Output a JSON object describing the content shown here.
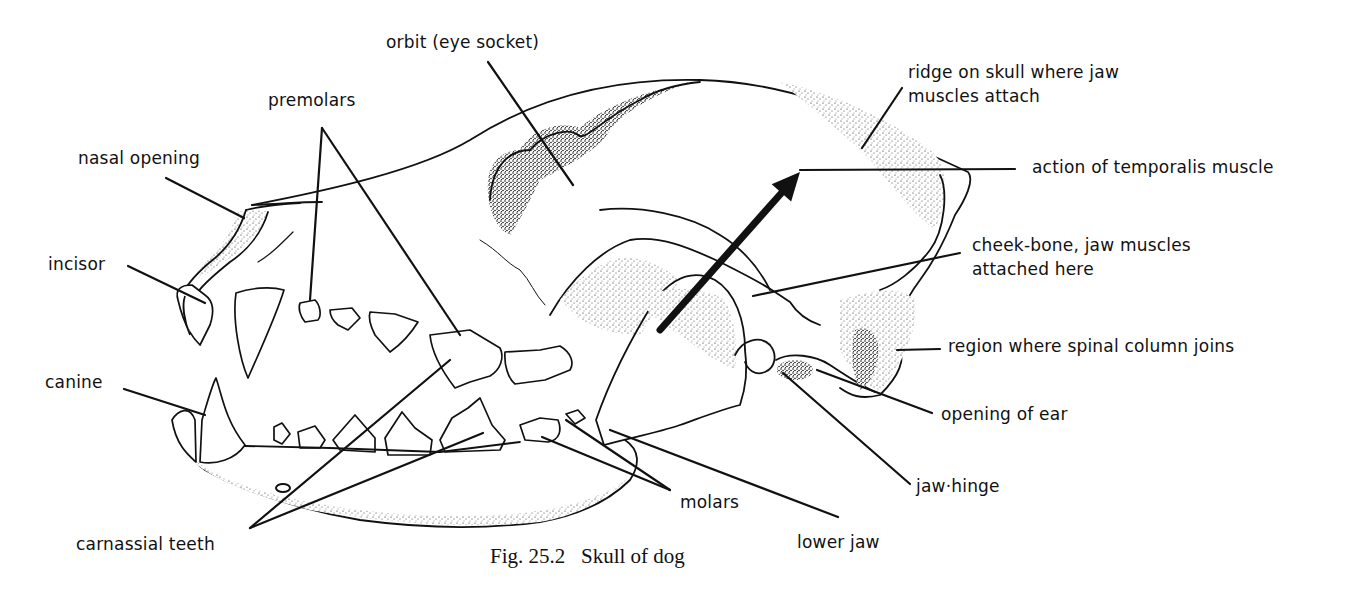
{
  "figure": {
    "caption": "Fig. 25.2   Skull of dog",
    "subject": "Skull of dog",
    "figure_number": "25.2",
    "colors": {
      "ink": "#111111",
      "background": "#ffffff"
    }
  },
  "labels": [
    {
      "id": "orbit",
      "text": "orbit (eye socket)",
      "x": 386,
      "y": 30
    },
    {
      "id": "premolars",
      "text": "premolars",
      "x": 268,
      "y": 88
    },
    {
      "id": "ridge",
      "text_lines": [
        "ridge on skull where jaw",
        "muscles attach"
      ],
      "x": 908,
      "y": 60
    },
    {
      "id": "nasal-opening",
      "text": "nasal opening",
      "x": 78,
      "y": 146
    },
    {
      "id": "temporalis",
      "text": "action of temporalis muscle",
      "x": 1032,
      "y": 155
    },
    {
      "id": "incisor",
      "text": "incisor",
      "x": 48,
      "y": 252
    },
    {
      "id": "cheek-bone",
      "text_lines": [
        "cheek-bone, jaw muscles",
        "attached here"
      ],
      "x": 972,
      "y": 233
    },
    {
      "id": "spinal-column",
      "text": "region where spinal column joins",
      "x": 948,
      "y": 334
    },
    {
      "id": "canine",
      "text": "canine",
      "x": 45,
      "y": 370
    },
    {
      "id": "ear-opening",
      "text": "opening of ear",
      "x": 941,
      "y": 402
    },
    {
      "id": "jaw-hinge",
      "text": "jaw·hinge",
      "x": 916,
      "y": 474
    },
    {
      "id": "molars",
      "text": "molars",
      "x": 680,
      "y": 490
    },
    {
      "id": "lower-jaw",
      "text": "lower jaw",
      "x": 797,
      "y": 530
    },
    {
      "id": "carnassial",
      "text": "carnassial teeth",
      "x": 76,
      "y": 532
    }
  ],
  "leader_lines": [
    {
      "label": "orbit",
      "x1": 488,
      "y1": 62,
      "x2": 573,
      "y2": 185
    },
    {
      "label": "premolars",
      "x1": 322,
      "y1": 128,
      "x2": 310,
      "y2": 300
    },
    {
      "label": "premolars",
      "x1": 322,
      "y1": 128,
      "x2": 460,
      "y2": 335
    },
    {
      "label": "ridge",
      "x1": 902,
      "y1": 88,
      "x2": 862,
      "y2": 148
    },
    {
      "label": "nasal-opening",
      "x1": 166,
      "y1": 178,
      "x2": 244,
      "y2": 218
    },
    {
      "label": "temporalis",
      "x1": 800,
      "y1": 170,
      "x2": 1015,
      "y2": 169
    },
    {
      "label": "incisor",
      "x1": 128,
      "y1": 266,
      "x2": 205,
      "y2": 303
    },
    {
      "label": "cheek-bone",
      "x1": 753,
      "y1": 296,
      "x2": 960,
      "y2": 253
    },
    {
      "label": "spinal-column",
      "x1": 897,
      "y1": 350,
      "x2": 940,
      "y2": 349
    },
    {
      "label": "canine",
      "x1": 124,
      "y1": 389,
      "x2": 205,
      "y2": 415
    },
    {
      "label": "ear-opening",
      "x1": 817,
      "y1": 370,
      "x2": 932,
      "y2": 413
    },
    {
      "label": "jaw-hinge",
      "x1": 783,
      "y1": 373,
      "x2": 910,
      "y2": 484
    },
    {
      "label": "molars",
      "x1": 542,
      "y1": 437,
      "x2": 670,
      "y2": 490
    },
    {
      "label": "molars",
      "x1": 566,
      "y1": 420,
      "x2": 670,
      "y2": 490
    },
    {
      "label": "lower-jaw",
      "x1": 610,
      "y1": 430,
      "x2": 838,
      "y2": 517
    },
    {
      "label": "carnassial",
      "x1": 250,
      "y1": 528,
      "x2": 450,
      "y2": 360
    },
    {
      "label": "carnassial",
      "x1": 250,
      "y1": 528,
      "x2": 483,
      "y2": 433
    }
  ],
  "arrow": {
    "label": "temporalis",
    "x1": 660,
    "y1": 330,
    "x2": 800,
    "y2": 172
  }
}
